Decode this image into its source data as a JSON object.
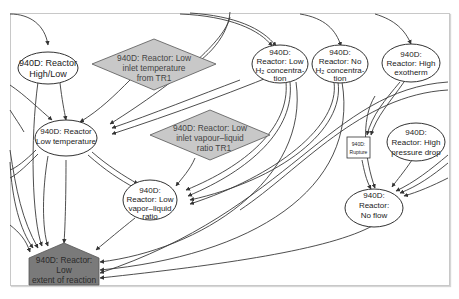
{
  "diagram": {
    "type": "cause-effect graph",
    "nodes": [
      {
        "id": "high_low",
        "shape": "ellipse",
        "lines": [
          "940D: Reactor",
          "High/Low"
        ]
      },
      {
        "id": "low_inlet_temp",
        "shape": "diamond",
        "lines": [
          "940D: Reactor: Low",
          "inlet temperature",
          "from TR1"
        ]
      },
      {
        "id": "low_h2",
        "shape": "ellipse",
        "lines": [
          "940D:",
          "Reactor: Low",
          "H₂ concentra-",
          "tion"
        ]
      },
      {
        "id": "no_h2",
        "shape": "ellipse",
        "lines": [
          "940D:",
          "Reactor: No",
          "H₂ concentra-",
          "tion"
        ]
      },
      {
        "id": "high_exotherm",
        "shape": "ellipse",
        "lines": [
          "940D:",
          "Reactor: High",
          "exotherm"
        ]
      },
      {
        "id": "low_temp",
        "shape": "ellipse",
        "lines": [
          "940D: Reactor",
          "Low temperature"
        ]
      },
      {
        "id": "low_inlet_vl",
        "shape": "diamond",
        "lines": [
          "940D: Reactor: Low",
          "inlet vapour–liquid",
          "ratio  TR1"
        ]
      },
      {
        "id": "rupture",
        "shape": "box",
        "lines": [
          "940D:",
          "Rupture"
        ]
      },
      {
        "id": "high_dp",
        "shape": "ellipse",
        "lines": [
          "940D:",
          "Reactor: High",
          "pressure drop"
        ]
      },
      {
        "id": "low_vl",
        "shape": "ellipse",
        "lines": [
          "940D:",
          "Reactor: Low",
          "vapor–liquid",
          "ratio"
        ]
      },
      {
        "id": "no_flow",
        "shape": "ellipse",
        "lines": [
          "940D:",
          "Reactor:",
          "No flow"
        ]
      },
      {
        "id": "low_extent",
        "shape": "pentagon",
        "lines": [
          "940D: Reactor:",
          "Low",
          "extent of reaction"
        ]
      }
    ],
    "edges": [
      [
        "high_low",
        "low_temp"
      ],
      [
        "high_low",
        "low_extent"
      ],
      [
        "low_inlet_temp",
        "low_temp"
      ],
      [
        "low_h2",
        "low_temp"
      ],
      [
        "no_h2",
        "low_temp"
      ],
      [
        "low_h2",
        "low_vl"
      ],
      [
        "no_h2",
        "low_vl"
      ],
      [
        "low_temp",
        "low_vl"
      ],
      [
        "low_temp",
        "low_extent"
      ],
      [
        "low_inlet_vl",
        "low_vl"
      ],
      [
        "low_vl",
        "low_extent"
      ],
      [
        "high_exotherm",
        "rupture"
      ],
      [
        "rupture",
        "no_flow"
      ],
      [
        "high_dp",
        "no_flow"
      ],
      [
        "no_flow",
        "low_extent"
      ]
    ]
  }
}
